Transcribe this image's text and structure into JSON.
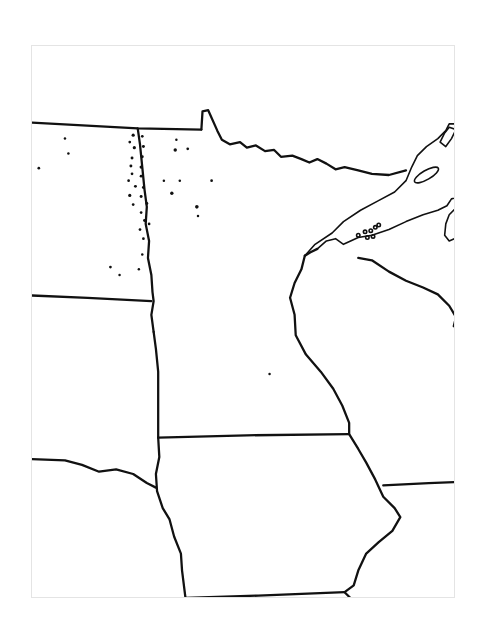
{
  "map": {
    "type": "blank outline map",
    "region": "Upper Midwest United States",
    "line_color": "#111111",
    "background": "#ffffff",
    "frame_border_color": "#e4e4e4",
    "labels": []
  }
}
